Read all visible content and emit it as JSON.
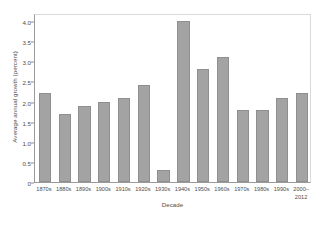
{
  "chart_data": {
    "type": "bar",
    "title": "",
    "xlabel": "Decade",
    "ylabel": "Average annual growth (percent)",
    "categories": [
      "1870s",
      "1880s",
      "1890s",
      "1900s",
      "1910s",
      "1920s",
      "1930s",
      "1940s",
      "1950s",
      "1960s",
      "1970s",
      "1980s",
      "1990s",
      "2000–\n2012"
    ],
    "values": [
      2.2,
      1.7,
      1.9,
      2.0,
      2.1,
      2.4,
      0.3,
      4.0,
      2.8,
      3.1,
      1.8,
      1.8,
      2.1,
      2.2
    ],
    "ylim": [
      0,
      4.2
    ],
    "yticks": [
      0,
      0.5,
      1.0,
      1.5,
      2.0,
      2.5,
      3.0,
      3.5,
      4.0
    ],
    "ytick_labels": [
      "0",
      "0.5",
      "1.0",
      "1.5",
      "2.0",
      "2.5",
      "3.0",
      "3.5",
      "4.0"
    ],
    "grid": false,
    "legend": null,
    "bar_color": "#a3a3a3",
    "bar_edge_color": "#8f8f8f",
    "axis_color": "#9a9a9a",
    "text_color": "#4d4d4d"
  }
}
